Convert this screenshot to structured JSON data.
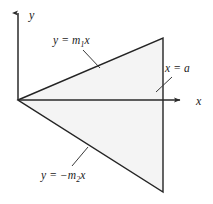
{
  "figure": {
    "background_color": "#ffffff",
    "width": 213,
    "height": 204
  },
  "axes": {
    "x_axis": {
      "label": "x",
      "label_x": 196,
      "label_y": 105,
      "start_x": 18,
      "start_y": 100,
      "end_x": 183,
      "end_y": 100,
      "arrow": "right",
      "color": "#2a2a2a"
    },
    "y_axis": {
      "label": "y",
      "label_x": 29,
      "label_y": 19,
      "start_x": 18,
      "start_y": 100,
      "end_x": 18,
      "end_y": 10,
      "arrow": "up",
      "color": "#2a2a2a"
    },
    "origin": {
      "x": 18,
      "y": 100
    }
  },
  "region": {
    "name": "triangle",
    "fill_color": "#f4f4f4",
    "stroke_color": "#242424",
    "stroke_width": 1.4,
    "vertices": [
      {
        "name": "origin",
        "x": 18,
        "y": 100
      },
      {
        "name": "top-right",
        "x": 163,
        "y": 38
      },
      {
        "name": "bottom-right",
        "x": 163,
        "y": 192
      }
    ]
  },
  "annotations": [
    {
      "id": "upper-line",
      "text_before": "y = m",
      "subscript": "1",
      "text_after": "x",
      "full_text": "y = m1x",
      "label_x": 53,
      "label_y": 44,
      "leader": {
        "x1": 83,
        "y1": 50,
        "x2": 100,
        "y2": 68
      }
    },
    {
      "id": "lower-line",
      "text_before": "y = −m",
      "subscript": "2",
      "text_after": "x",
      "full_text": "y = -m2x",
      "label_x": 41,
      "label_y": 179,
      "leader": {
        "x1": 72,
        "y1": 166,
        "x2": 88,
        "y2": 147
      }
    },
    {
      "id": "vertical-line",
      "text_before": "x = a",
      "subscript": "",
      "text_after": "",
      "full_text": "x = a",
      "label_x": 165,
      "label_y": 72,
      "leader": {
        "x1": 156,
        "y1": 92,
        "x2": 172,
        "y2": 77
      }
    }
  ],
  "colors": {
    "stroke": "#242424",
    "axis": "#2a2a2a",
    "fill": "#f4f4f4",
    "text": "#1b1b1b",
    "leader": "#3a3a3a"
  }
}
